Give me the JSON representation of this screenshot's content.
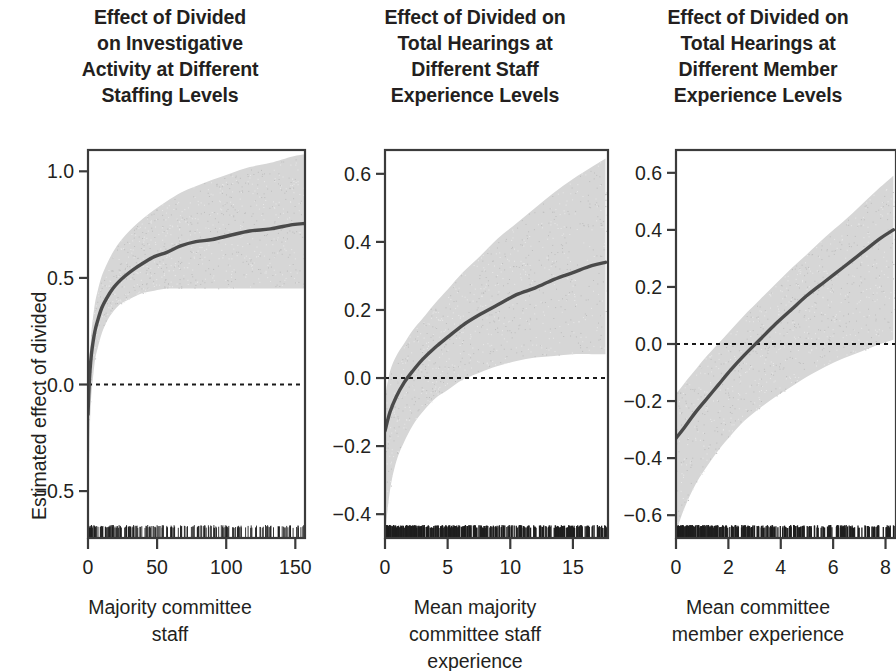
{
  "figure": {
    "ylabel": "Estimated effect of divided",
    "band_color": "#d6d6d6",
    "line_color": "#4a4a4a",
    "axis_color": "#3b3b3b",
    "zero_line_color": "#1a1a1a"
  },
  "chart_data": [
    {
      "type": "line",
      "panel": 1,
      "title": [
        "Effect of Divided",
        "on Investigative",
        "Activity at Different",
        "Staffing Levels"
      ],
      "xlabel": [
        "Majority committee",
        "staff"
      ],
      "ylabel": "Estimated effect of divided",
      "xlim": [
        0,
        157
      ],
      "ylim": [
        -0.72,
        1.1
      ],
      "xticks": [
        0,
        50,
        100,
        150
      ],
      "xticklabels": [
        "0",
        "50",
        "100",
        "150"
      ],
      "yticks": [
        1.0,
        0.5,
        0.0,
        -0.5
      ],
      "yticklabels": [
        "1.0",
        "0.5",
        "0.0",
        "-0.5"
      ],
      "grid": false,
      "legend": null,
      "zero_reference_line": 0.0,
      "x": [
        0,
        1,
        2,
        3,
        5,
        7,
        10,
        14,
        18,
        22,
        27,
        33,
        40,
        48,
        57,
        67,
        78,
        90,
        103,
        117,
        132,
        148,
        157
      ],
      "fit": [
        -0.14,
        0.02,
        0.11,
        0.17,
        0.25,
        0.3,
        0.36,
        0.41,
        0.45,
        0.48,
        0.51,
        0.54,
        0.57,
        0.6,
        0.62,
        0.65,
        0.67,
        0.68,
        0.7,
        0.72,
        0.73,
        0.75,
        0.755
      ],
      "ci_upper": [
        -0.09,
        0.1,
        0.21,
        0.28,
        0.38,
        0.44,
        0.51,
        0.57,
        0.62,
        0.66,
        0.7,
        0.74,
        0.78,
        0.82,
        0.86,
        0.9,
        0.93,
        0.96,
        0.99,
        1.02,
        1.04,
        1.07,
        1.08
      ],
      "ci_lower": [
        -0.7,
        -0.3,
        -0.1,
        -0.01,
        0.11,
        0.17,
        0.24,
        0.3,
        0.34,
        0.37,
        0.39,
        0.41,
        0.43,
        0.44,
        0.45,
        0.45,
        0.45,
        0.45,
        0.45,
        0.45,
        0.45,
        0.45,
        0.45
      ],
      "rug": true,
      "rug_description": "dense tick marks along bottom axis, concentrated between 0 and 100"
    },
    {
      "type": "line",
      "panel": 2,
      "title": [
        "Effect of Divided on",
        "Total Hearings at",
        "Different Staff",
        "Experience Levels"
      ],
      "xlabel": [
        "Mean majority",
        "committee staff",
        "experience"
      ],
      "ylabel": "Estimated effect of divided",
      "xlim": [
        0,
        17.8
      ],
      "ylim": [
        -0.47,
        0.67
      ],
      "xticks": [
        0,
        5,
        10,
        15
      ],
      "xticklabels": [
        "0",
        "5",
        "10",
        "15"
      ],
      "yticks": [
        0.6,
        0.4,
        0.2,
        0.0,
        -0.2,
        -0.4
      ],
      "yticklabels": [
        "0.6",
        "0.4",
        "0.2",
        "0.0",
        "-0.2",
        "-0.4"
      ],
      "grid": false,
      "legend": null,
      "zero_reference_line": 0.0,
      "x": [
        0,
        0.4,
        0.9,
        1.5,
        2.2,
        3.0,
        4.0,
        5.0,
        6.2,
        7.5,
        9.0,
        10.5,
        12.0,
        13.5,
        15.0,
        16.5,
        17.6
      ],
      "fit": [
        -0.155,
        -0.1,
        -0.055,
        -0.015,
        0.02,
        0.055,
        0.09,
        0.12,
        0.155,
        0.185,
        0.215,
        0.245,
        0.265,
        0.29,
        0.31,
        0.33,
        0.34
      ],
      "ci_upper": [
        -0.055,
        0.02,
        0.065,
        0.1,
        0.14,
        0.175,
        0.22,
        0.26,
        0.31,
        0.355,
        0.41,
        0.455,
        0.5,
        0.545,
        0.585,
        0.62,
        0.645
      ],
      "ci_lower": [
        -0.46,
        -0.33,
        -0.245,
        -0.19,
        -0.14,
        -0.1,
        -0.06,
        -0.035,
        -0.005,
        0.015,
        0.035,
        0.05,
        0.06,
        0.065,
        0.07,
        0.07,
        0.07
      ],
      "rug": true,
      "rug_description": "very dense black rug along bottom axis, densest between 0 and 8"
    },
    {
      "type": "line",
      "panel": 3,
      "title": [
        "Effect of Divided on",
        "Total Hearings at",
        "Different Member",
        "Experience Levels"
      ],
      "xlabel": [
        "Mean committee",
        "member experience"
      ],
      "ylabel": "Estimated effect of divided",
      "xlim": [
        0,
        8.4
      ],
      "ylim": [
        -0.68,
        0.68
      ],
      "xticks": [
        0,
        2,
        4,
        6,
        8
      ],
      "xticklabels": [
        "0",
        "2",
        "4",
        "6",
        "8"
      ],
      "yticks": [
        0.6,
        0.4,
        0.2,
        0.0,
        -0.2,
        -0.4,
        -0.6
      ],
      "yticklabels": [
        "0.6",
        "0.4",
        "0.2",
        "0.0",
        "-0.2",
        "-0.4",
        "-0.6"
      ],
      "grid": false,
      "legend": null,
      "zero_reference_line": 0.0,
      "x": [
        0,
        0.3,
        0.7,
        1.1,
        1.6,
        2.1,
        2.6,
        3.2,
        3.8,
        4.4,
        5.0,
        5.7,
        6.4,
        7.1,
        7.8,
        8.3
      ],
      "fit": [
        -0.33,
        -0.295,
        -0.245,
        -0.2,
        -0.145,
        -0.09,
        -0.04,
        0.015,
        0.07,
        0.12,
        0.17,
        0.22,
        0.27,
        0.32,
        0.37,
        0.4
      ],
      "ci_upper": [
        -0.175,
        -0.14,
        -0.095,
        -0.05,
        0.0,
        0.05,
        0.1,
        0.155,
        0.21,
        0.265,
        0.315,
        0.375,
        0.43,
        0.49,
        0.55,
        0.59
      ],
      "ci_lower": [
        -0.66,
        -0.58,
        -0.5,
        -0.44,
        -0.375,
        -0.32,
        -0.27,
        -0.225,
        -0.185,
        -0.15,
        -0.115,
        -0.08,
        -0.05,
        -0.025,
        0.0,
        0.015
      ],
      "rug": true,
      "rug_description": "dense black rug along bottom axis, densest between 0.5 and 5"
    }
  ]
}
